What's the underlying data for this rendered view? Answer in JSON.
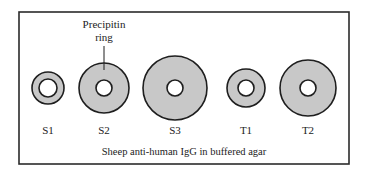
{
  "diagram": {
    "frame": {
      "x": 19,
      "y": 12,
      "width": 330,
      "height": 152,
      "stroke": "#2b2b2b"
    },
    "colors": {
      "ring_fill": "#c8c8c8",
      "stroke": "#1e1e1e",
      "well_fill": "#ffffff",
      "background": "#ffffff"
    },
    "annotation": {
      "line1": "Precipitin",
      "line2": "ring",
      "text_x": 104,
      "line1_y": 28,
      "line2_y": 41,
      "pointer": {
        "x": 104,
        "y1": 46,
        "y2": 70
      }
    },
    "wells": [
      {
        "label": "S1",
        "cx": 48,
        "cy": 88,
        "outer_r": 16,
        "inner_r": 9
      },
      {
        "label": "S2",
        "cx": 104,
        "cy": 88,
        "outer_r": 25,
        "inner_r": 8
      },
      {
        "label": "S3",
        "cx": 175,
        "cy": 88,
        "outer_r": 32,
        "inner_r": 8
      },
      {
        "label": "T1",
        "cx": 246,
        "cy": 88,
        "outer_r": 19,
        "inner_r": 8
      },
      {
        "label": "T2",
        "cx": 308,
        "cy": 88,
        "outer_r": 28,
        "inner_r": 8
      }
    ],
    "label_y": 134,
    "caption": "Sheep anti-human IgG in buffered agar",
    "caption_x": 184,
    "caption_y": 155
  }
}
